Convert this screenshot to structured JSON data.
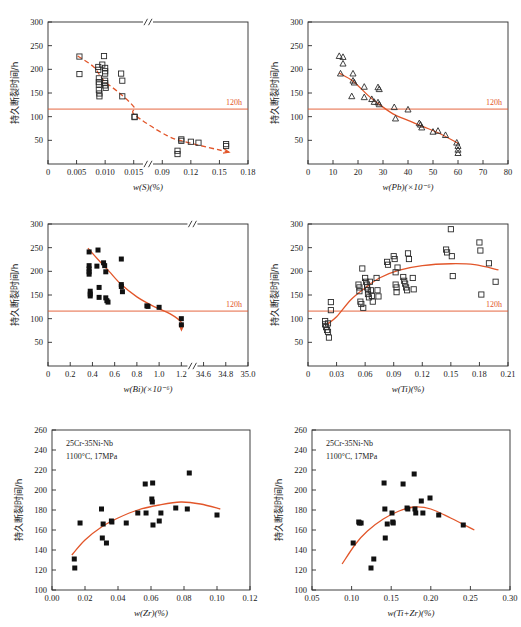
{
  "figure": {
    "background": "#ffffff",
    "accent_color": "#e2562a",
    "marker_color": "#111111",
    "width": 521,
    "height": 627
  },
  "common": {
    "ylabel": "持久断裂时间/h",
    "threshold_label": "120h",
    "threshold_value": 120,
    "annotation_line1": "25Cr-35Ni-Nb",
    "annotation_line2": "1100°C, 17MPa"
  },
  "chart_data": [
    {
      "id": "panel-s",
      "type": "scatter",
      "title": "",
      "xlabel": "w(S)(%)",
      "ylabel": "持久断裂时间/h",
      "marker": "open-square",
      "trend_style": "dashed-arrow",
      "axis_break": true,
      "xticks": [
        "0",
        "0.005",
        "0.010",
        "0.015",
        "0.09",
        "0.12",
        "0.15",
        "0.18"
      ],
      "xtick_values": [
        0,
        0.005,
        0.01,
        0.015,
        0.09,
        0.12,
        0.15,
        0.18
      ],
      "yticks": [
        "50",
        "100",
        "150",
        "200",
        "250",
        "300"
      ],
      "ylim": [
        0,
        300
      ],
      "grid": false,
      "points": [
        [
          0.0055,
          227
        ],
        [
          0.0055,
          190
        ],
        [
          0.0088,
          205
        ],
        [
          0.0088,
          199
        ],
        [
          0.0089,
          181
        ],
        [
          0.0089,
          173
        ],
        [
          0.0089,
          168
        ],
        [
          0.0089,
          156
        ],
        [
          0.009,
          149
        ],
        [
          0.009,
          143
        ],
        [
          0.0095,
          210
        ],
        [
          0.0098,
          228
        ],
        [
          0.01,
          203
        ],
        [
          0.01,
          196
        ],
        [
          0.01,
          191
        ],
        [
          0.01,
          176
        ],
        [
          0.01,
          171
        ],
        [
          0.01,
          166
        ],
        [
          0.0101,
          161
        ],
        [
          0.0128,
          191
        ],
        [
          0.013,
          176
        ],
        [
          0.013,
          143
        ],
        [
          0.0172,
          100
        ],
        [
          0.0173,
          99
        ],
        [
          0.106,
          28
        ],
        [
          0.106,
          21
        ],
        [
          0.11,
          52
        ],
        [
          0.11,
          49
        ],
        [
          0.12,
          47
        ],
        [
          0.128,
          45
        ],
        [
          0.157,
          42
        ],
        [
          0.157,
          38
        ]
      ]
    },
    {
      "id": "panel-pb",
      "type": "scatter",
      "title": "",
      "xlabel": "w(Pb)(×10⁻⁶)",
      "ylabel": "持久断裂时间/h",
      "marker": "open-triangle",
      "trend_style": "solid",
      "axis_break": false,
      "xticks": [
        "0",
        "10",
        "20",
        "30",
        "40",
        "50",
        "60",
        "70",
        "80"
      ],
      "xtick_values": [
        0,
        10,
        20,
        30,
        40,
        50,
        60,
        70,
        80
      ],
      "yticks": [
        "50",
        "100",
        "150",
        "200",
        "250",
        "300"
      ],
      "ylim": [
        0,
        300
      ],
      "grid": false,
      "points": [
        [
          12.5,
          228
        ],
        [
          14.0,
          226
        ],
        [
          14.0,
          212
        ],
        [
          13.0,
          191
        ],
        [
          18.0,
          191
        ],
        [
          18.0,
          176
        ],
        [
          18.5,
          172
        ],
        [
          17.5,
          143
        ],
        [
          22.5,
          163
        ],
        [
          22.5,
          141
        ],
        [
          25.5,
          137
        ],
        [
          26.5,
          131
        ],
        [
          28.0,
          162
        ],
        [
          28.5,
          158
        ],
        [
          28.0,
          130
        ],
        [
          28.5,
          126
        ],
        [
          34.5,
          120
        ],
        [
          35.0,
          96
        ],
        [
          40.0,
          115
        ],
        [
          44.5,
          86
        ],
        [
          45.0,
          83
        ],
        [
          45.5,
          77
        ],
        [
          50.0,
          68
        ],
        [
          52.0,
          70
        ],
        [
          55.0,
          61
        ],
        [
          59.5,
          45
        ],
        [
          60.0,
          38
        ],
        [
          60.0,
          30
        ],
        [
          60.0,
          23
        ]
      ]
    },
    {
      "id": "panel-bi",
      "type": "scatter",
      "title": "",
      "xlabel": "w(Bi)(×10⁻⁶)",
      "ylabel": "持久断裂时间/h",
      "marker": "solid-square",
      "trend_style": "solid-arrow",
      "axis_break": true,
      "xticks": [
        "0",
        "0.2",
        "0.4",
        "0.6",
        "0.8",
        "1.0",
        "1.2",
        "34.6",
        "34.8",
        "35.0"
      ],
      "xtick_values": [
        0,
        0.2,
        0.4,
        0.6,
        0.8,
        1.0,
        1.2,
        34.6,
        34.8,
        35.0
      ],
      "yticks": [
        "50",
        "100",
        "150",
        "200",
        "250",
        "300"
      ],
      "ylim": [
        0,
        300
      ],
      "grid": false,
      "points": [
        [
          0.37,
          241
        ],
        [
          0.37,
          212
        ],
        [
          0.37,
          205
        ],
        [
          0.37,
          199
        ],
        [
          0.37,
          194
        ],
        [
          0.38,
          158
        ],
        [
          0.38,
          152
        ],
        [
          0.38,
          148
        ],
        [
          0.44,
          211
        ],
        [
          0.45,
          245
        ],
        [
          0.46,
          166
        ],
        [
          0.46,
          145
        ],
        [
          0.5,
          218
        ],
        [
          0.51,
          212
        ],
        [
          0.52,
          199
        ],
        [
          0.52,
          144
        ],
        [
          0.53,
          138
        ],
        [
          0.54,
          135
        ],
        [
          0.66,
          226
        ],
        [
          0.66,
          172
        ],
        [
          0.66,
          168
        ],
        [
          0.67,
          157
        ],
        [
          0.89,
          127
        ],
        [
          0.9,
          126
        ],
        [
          1.0,
          124
        ],
        [
          1.21,
          100
        ],
        [
          1.29,
          87
        ]
      ]
    },
    {
      "id": "panel-ti",
      "type": "scatter",
      "title": "",
      "xlabel": "w(Ti)(%)",
      "ylabel": "持久断裂时间/h",
      "marker": "open-square",
      "trend_style": "solid",
      "axis_break": false,
      "xticks": [
        "0",
        "0.03",
        "0.06",
        "0.09",
        "0.12",
        "0.15",
        "0.18",
        "0.21"
      ],
      "xtick_values": [
        0,
        0.03,
        0.06,
        0.09,
        0.12,
        0.15,
        0.18,
        0.21
      ],
      "yticks": [
        "50",
        "100",
        "150",
        "200",
        "250",
        "300"
      ],
      "ylim": [
        0,
        300
      ],
      "grid": false,
      "points": [
        [
          0.018,
          95
        ],
        [
          0.018,
          88
        ],
        [
          0.019,
          82
        ],
        [
          0.02,
          76
        ],
        [
          0.021,
          90
        ],
        [
          0.021,
          72
        ],
        [
          0.022,
          60
        ],
        [
          0.024,
          135
        ],
        [
          0.024,
          118
        ],
        [
          0.053,
          172
        ],
        [
          0.054,
          166
        ],
        [
          0.054,
          158
        ],
        [
          0.055,
          136
        ],
        [
          0.056,
          131
        ],
        [
          0.057,
          206
        ],
        [
          0.058,
          123
        ],
        [
          0.06,
          186
        ],
        [
          0.061,
          178
        ],
        [
          0.062,
          172
        ],
        [
          0.062,
          166
        ],
        [
          0.063,
          160
        ],
        [
          0.063,
          152
        ],
        [
          0.064,
          145
        ],
        [
          0.065,
          178
        ],
        [
          0.066,
          160
        ],
        [
          0.067,
          148
        ],
        [
          0.068,
          136
        ],
        [
          0.072,
          186
        ],
        [
          0.073,
          160
        ],
        [
          0.074,
          147
        ],
        [
          0.083,
          220
        ],
        [
          0.084,
          214
        ],
        [
          0.09,
          232
        ],
        [
          0.091,
          226
        ],
        [
          0.092,
          198
        ],
        [
          0.092,
          172
        ],
        [
          0.093,
          166
        ],
        [
          0.093,
          156
        ],
        [
          0.094,
          208
        ],
        [
          0.1,
          188
        ],
        [
          0.101,
          180
        ],
        [
          0.102,
          174
        ],
        [
          0.103,
          166
        ],
        [
          0.104,
          160
        ],
        [
          0.105,
          238
        ],
        [
          0.106,
          226
        ],
        [
          0.11,
          186
        ],
        [
          0.111,
          162
        ],
        [
          0.145,
          246
        ],
        [
          0.146,
          240
        ],
        [
          0.15,
          289
        ],
        [
          0.151,
          232
        ],
        [
          0.152,
          190
        ],
        [
          0.18,
          261
        ],
        [
          0.181,
          244
        ],
        [
          0.182,
          151
        ],
        [
          0.19,
          217
        ],
        [
          0.197,
          178
        ]
      ]
    },
    {
      "id": "panel-zr",
      "type": "scatter",
      "title": "",
      "xlabel": "w(Zr)(%)",
      "ylabel": "持久断裂时间/h",
      "marker": "solid-square",
      "trend_style": "solid",
      "axis_break": false,
      "annotation": [
        "25Cr-35Ni-Nb",
        "1100°C, 17MPa"
      ],
      "xticks": [
        "0.00",
        "0.02",
        "0.04",
        "0.06",
        "0.08",
        "0.10",
        "0.12"
      ],
      "xtick_values": [
        0.0,
        0.02,
        0.04,
        0.06,
        0.08,
        0.1,
        0.12
      ],
      "yticks": [
        "100",
        "120",
        "140",
        "160",
        "180",
        "200",
        "220",
        "240",
        "260"
      ],
      "ylim": [
        100,
        260
      ],
      "grid": false,
      "points": [
        [
          0.0135,
          131
        ],
        [
          0.0138,
          122
        ],
        [
          0.017,
          167
        ],
        [
          0.03,
          181
        ],
        [
          0.0305,
          152
        ],
        [
          0.031,
          166
        ],
        [
          0.033,
          147
        ],
        [
          0.036,
          169
        ],
        [
          0.0363,
          168
        ],
        [
          0.045,
          167
        ],
        [
          0.052,
          177
        ],
        [
          0.0565,
          206
        ],
        [
          0.057,
          177
        ],
        [
          0.0605,
          191
        ],
        [
          0.0608,
          188
        ],
        [
          0.061,
          207
        ],
        [
          0.0612,
          165
        ],
        [
          0.065,
          169
        ],
        [
          0.066,
          177
        ],
        [
          0.075,
          182
        ],
        [
          0.082,
          181
        ],
        [
          0.0832,
          217
        ],
        [
          0.1,
          175
        ]
      ]
    },
    {
      "id": "panel-tizr",
      "type": "scatter",
      "title": "",
      "xlabel": "w(Ti+Zr)(%)",
      "ylabel": "持久断裂时间/h",
      "marker": "solid-square",
      "trend_style": "solid",
      "axis_break": false,
      "annotation": [
        "25Cr-35Ni-Nb",
        "1100°C, 17MPa"
      ],
      "xticks": [
        "0.05",
        "0.10",
        "0.15",
        "0.20",
        "0.25",
        "0.30"
      ],
      "xtick_values": [
        0.05,
        0.1,
        0.15,
        0.2,
        0.25,
        0.3
      ],
      "yticks": [
        "100",
        "120",
        "140",
        "160",
        "180",
        "200",
        "220",
        "240",
        "260"
      ],
      "ylim": [
        100,
        260
      ],
      "grid": false,
      "points": [
        [
          0.102,
          147
        ],
        [
          0.109,
          168
        ],
        [
          0.11,
          167
        ],
        [
          0.112,
          167
        ],
        [
          0.1245,
          122
        ],
        [
          0.128,
          131
        ],
        [
          0.141,
          207
        ],
        [
          0.142,
          181
        ],
        [
          0.1425,
          152
        ],
        [
          0.145,
          166
        ],
        [
          0.151,
          177
        ],
        [
          0.152,
          168
        ],
        [
          0.1525,
          167
        ],
        [
          0.165,
          206
        ],
        [
          0.17,
          182
        ],
        [
          0.171,
          181
        ],
        [
          0.179,
          216
        ],
        [
          0.18,
          181
        ],
        [
          0.181,
          177
        ],
        [
          0.188,
          189
        ],
        [
          0.19,
          177
        ],
        [
          0.199,
          192
        ],
        [
          0.21,
          175
        ],
        [
          0.241,
          165
        ]
      ]
    }
  ]
}
